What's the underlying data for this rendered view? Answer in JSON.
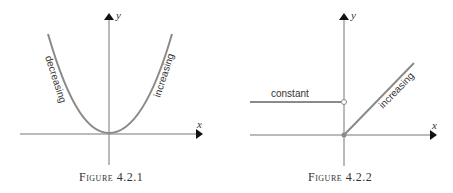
{
  "figures": [
    {
      "caption_word": "Figure",
      "caption_num": "4.2.1",
      "axis_x": "x",
      "axis_y": "y",
      "labels": {
        "left": "decreasing",
        "right": "increasing"
      }
    },
    {
      "caption_word": "Figure",
      "caption_num": "4.2.2",
      "axis_x": "x",
      "axis_y": "y",
      "labels": {
        "left": "constant",
        "right": "increasing"
      }
    }
  ],
  "colors": {
    "curve": "#8a8a8a",
    "axis": "#555555",
    "arrow": "#111111"
  }
}
